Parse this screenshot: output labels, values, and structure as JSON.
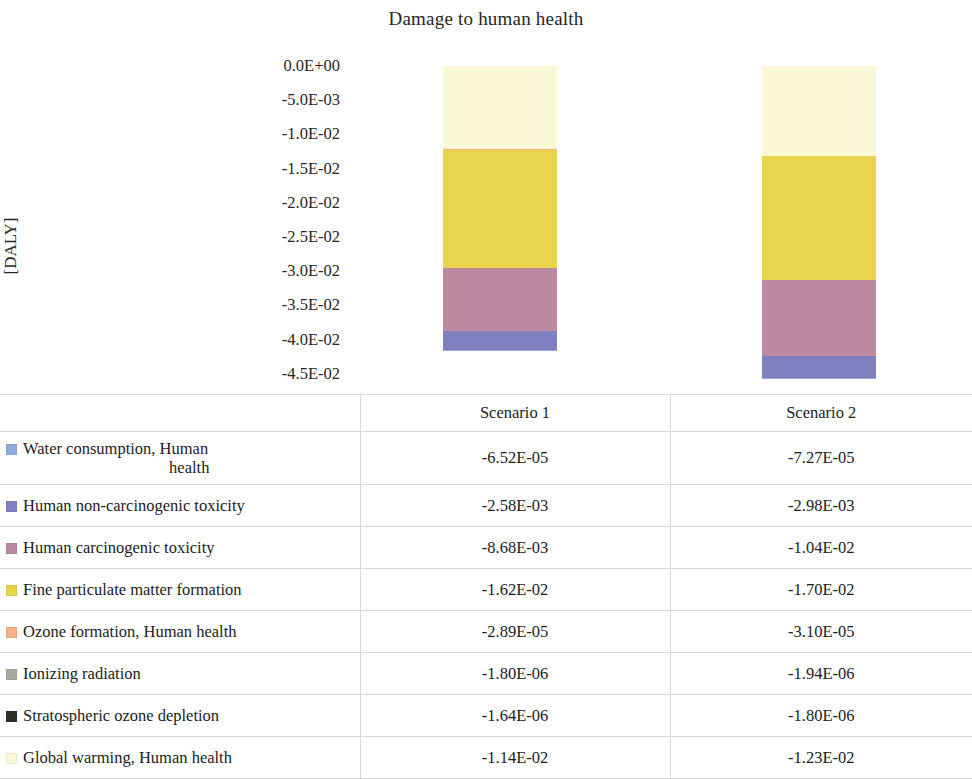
{
  "chart_data": {
    "type": "bar",
    "stacked": true,
    "orientation": "vertical",
    "title": "Damage to human health",
    "xlabel": "",
    "ylabel": "[DALY]",
    "ylim": [
      -0.045,
      0.0
    ],
    "grid": false,
    "legend_position": "table-left",
    "categories": [
      "Scenario 1",
      "Scenario 2"
    ],
    "ytick_labels": [
      "0.0E+00",
      "-5.0E-03",
      "-1.0E-02",
      "-1.5E-02",
      "-2.0E-02",
      "-2.5E-02",
      "-3.0E-02",
      "-3.5E-02",
      "-4.0E-02",
      "-4.5E-02"
    ],
    "ytick_values": [
      0.0,
      -0.005,
      -0.01,
      -0.015,
      -0.02,
      -0.025,
      -0.03,
      -0.035,
      -0.04,
      -0.045
    ],
    "series": [
      {
        "name": "Water consumption, Human health",
        "color": "#8FAADC",
        "values": [
          -6.52e-05,
          -7.27e-05
        ],
        "value_labels": [
          "-6.52E-05",
          "-7.27E-05"
        ]
      },
      {
        "name": "Human non-carcinogenic toxicity",
        "color": "#8080C0",
        "values": [
          -0.00258,
          -0.00298
        ],
        "value_labels": [
          "-2.58E-03",
          "-2.98E-03"
        ]
      },
      {
        "name": "Human carcinogenic toxicity",
        "color": "#BC8AA0",
        "values": [
          -0.00868,
          -0.0104
        ],
        "value_labels": [
          "-8.68E-03",
          "-1.04E-02"
        ]
      },
      {
        "name": "Fine particulate matter formation",
        "color": "#E8D44D",
        "values": [
          -0.0162,
          -0.017
        ],
        "value_labels": [
          "-1.62E-02",
          "-1.70E-02"
        ]
      },
      {
        "name": "Ozone formation, Human health",
        "color": "#F4B183",
        "values": [
          -2.89e-05,
          -3.1e-05
        ],
        "value_labels": [
          "-2.89E-05",
          "-3.10E-05"
        ]
      },
      {
        "name": "Ionizing radiation",
        "color": "#A9A9A0",
        "values": [
          -1.8e-06,
          -1.94e-06
        ],
        "value_labels": [
          "-1.80E-06",
          "-1.94E-06"
        ]
      },
      {
        "name": "Stratospheric ozone depletion",
        "color": "#2E3028",
        "values": [
          -1.64e-06,
          -1.8e-06
        ],
        "value_labels": [
          "-1.64E-06",
          "-1.80E-06"
        ]
      },
      {
        "name": "Global warming, Human health",
        "color": "#FBF8D8",
        "values": [
          -0.0114,
          -0.0123
        ],
        "value_labels": [
          "-1.14E-02",
          "-1.23E-02"
        ]
      }
    ]
  },
  "table": {
    "header": {
      "legend_column": "",
      "columns": [
        "Scenario 1",
        "Scenario 2"
      ]
    },
    "rows": [
      {
        "label_line1": "Water consumption, Human",
        "label_line2": "health",
        "swatch": "#8FAADC",
        "s1": "-6.52E-05",
        "s2": "-7.27E-05"
      },
      {
        "label_line1": "Human non-carcinogenic toxicity",
        "label_line2": "",
        "swatch": "#8080C0",
        "s1": "-2.58E-03",
        "s2": "-2.98E-03"
      },
      {
        "label_line1": "Human carcinogenic toxicity",
        "label_line2": "",
        "swatch": "#BC8AA0",
        "s1": "-8.68E-03",
        "s2": "-1.04E-02"
      },
      {
        "label_line1": "Fine particulate matter formation",
        "label_line2": "",
        "swatch": "#E8D44D",
        "s1": "-1.62E-02",
        "s2": "-1.70E-02"
      },
      {
        "label_line1": "Ozone formation, Human health",
        "label_line2": "",
        "swatch": "#F4B183",
        "s1": "-2.89E-05",
        "s2": "-3.10E-05"
      },
      {
        "label_line1": "Ionizing radiation",
        "label_line2": "",
        "swatch": "#A9A9A0",
        "s1": "-1.80E-06",
        "s2": "-1.94E-06"
      },
      {
        "label_line1": "Stratospheric ozone depletion",
        "label_line2": "",
        "swatch": "#2E3028",
        "s1": "-1.64E-06",
        "s2": "-1.80E-06"
      },
      {
        "label_line1": "Global warming, Human health",
        "label_line2": "",
        "swatch": "#FBF8D8",
        "s1": "-1.14E-02",
        "s2": "-1.23E-02"
      }
    ]
  },
  "plot_geometry": {
    "top_y_px": 66,
    "px_per_unit": 7307,
    "bars": [
      {
        "left_px": 443,
        "width_px": 114
      },
      {
        "left_px": 762,
        "width_px": 114
      }
    ]
  }
}
